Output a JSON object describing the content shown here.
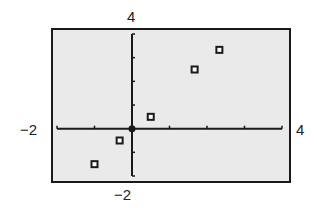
{
  "chart_data": {
    "type": "scatter",
    "title": "",
    "xlabel": "",
    "ylabel": "",
    "xlim": [
      -2,
      4
    ],
    "ylim": [
      -2,
      4
    ],
    "xscale": 1,
    "yscale": 1,
    "grid": false,
    "legend": null,
    "window_labels": {
      "xmin": "−2",
      "xmax": "4",
      "ymin": "−2",
      "ymax": "4"
    },
    "series": [
      {
        "name": "data",
        "marker": "hollow-square",
        "points": [
          {
            "x": -1.0,
            "y": -1.5
          },
          {
            "x": -0.33,
            "y": -0.5
          },
          {
            "x": 0.5,
            "y": 0.5
          },
          {
            "x": 1.67,
            "y": 2.5
          },
          {
            "x": 2.33,
            "y": 3.33
          }
        ]
      }
    ]
  },
  "colors": {
    "frame": "#1a1a1a",
    "background": "#eaeaea",
    "axis": "#1a1a1a",
    "marker": "#1a1a1a"
  }
}
